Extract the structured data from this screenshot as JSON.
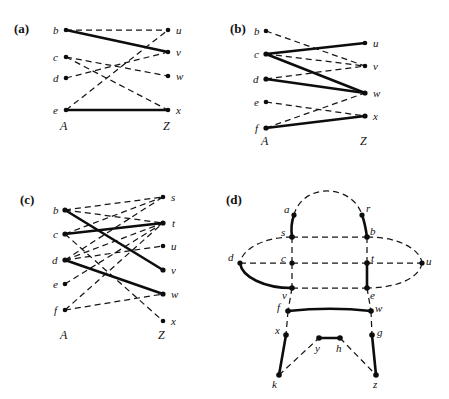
{
  "figure": {
    "panels": [
      {
        "id": "a",
        "label": "(a)",
        "type": "bipartite",
        "left_set_label": "A",
        "right_set_label": "Z",
        "left_nodes": [
          "b",
          "c",
          "d",
          "e"
        ],
        "right_nodes": [
          "u",
          "v",
          "w",
          "x"
        ],
        "edges": [
          {
            "from": "b",
            "to": "u",
            "style": "dashed"
          },
          {
            "from": "b",
            "to": "v",
            "style": "solid"
          },
          {
            "from": "c",
            "to": "w",
            "style": "dashed"
          },
          {
            "from": "c",
            "to": "x",
            "style": "dashed"
          },
          {
            "from": "d",
            "to": "v",
            "style": "dashed"
          },
          {
            "from": "e",
            "to": "u",
            "style": "dashed"
          },
          {
            "from": "e",
            "to": "x",
            "style": "solid"
          }
        ]
      },
      {
        "id": "b",
        "label": "(b)",
        "type": "bipartite",
        "left_set_label": "A",
        "right_set_label": "Z",
        "left_nodes": [
          "b",
          "c",
          "d",
          "e",
          "f"
        ],
        "right_nodes": [
          "u",
          "v",
          "w",
          "x"
        ],
        "edges": [
          {
            "from": "b",
            "to": "v",
            "style": "dashed"
          },
          {
            "from": "c",
            "to": "u",
            "style": "solid"
          },
          {
            "from": "c",
            "to": "w",
            "style": "solid"
          },
          {
            "from": "d",
            "to": "v",
            "style": "dashed"
          },
          {
            "from": "d",
            "to": "w",
            "style": "solid"
          },
          {
            "from": "e",
            "to": "x",
            "style": "dashed"
          },
          {
            "from": "f",
            "to": "w",
            "style": "dashed"
          },
          {
            "from": "f",
            "to": "x",
            "style": "solid"
          }
        ]
      },
      {
        "id": "c",
        "label": "(c)",
        "type": "bipartite",
        "left_set_label": "A",
        "right_set_label": "Z",
        "left_nodes": [
          "b",
          "c",
          "d",
          "e",
          "f"
        ],
        "right_nodes": [
          "s",
          "t",
          "u",
          "v",
          "w",
          "x"
        ],
        "edges": [
          {
            "from": "b",
            "to": "t",
            "style": "dashed"
          },
          {
            "from": "b",
            "to": "v",
            "style": "solid"
          },
          {
            "from": "c",
            "to": "s",
            "style": "dashed"
          },
          {
            "from": "c",
            "to": "t",
            "style": "solid"
          },
          {
            "from": "d",
            "to": "s",
            "style": "dashed"
          },
          {
            "from": "d",
            "to": "t",
            "style": "dashed"
          },
          {
            "from": "d",
            "to": "u",
            "style": "dashed"
          },
          {
            "from": "d",
            "to": "v",
            "style": "solid"
          },
          {
            "from": "d",
            "to": "w",
            "style": "solid"
          },
          {
            "from": "e",
            "to": "t",
            "style": "dashed"
          },
          {
            "from": "f",
            "to": "t",
            "style": "dashed"
          },
          {
            "from": "f",
            "to": "w",
            "style": "dashed"
          },
          {
            "from": "c",
            "to": "x",
            "style": "dashed"
          }
        ]
      },
      {
        "id": "d",
        "label": "(d)",
        "type": "general",
        "nodes": [
          "a",
          "r",
          "s",
          "b",
          "d",
          "c",
          "t",
          "u",
          "v",
          "e",
          "f",
          "w",
          "x",
          "g",
          "y",
          "h",
          "k",
          "z"
        ],
        "edges": [
          {
            "from": "a",
            "to": "r",
            "style": "dashed"
          },
          {
            "from": "a",
            "to": "s",
            "style": "solid"
          },
          {
            "from": "r",
            "to": "b",
            "style": "solid"
          },
          {
            "from": "s",
            "to": "b",
            "style": "dashed"
          },
          {
            "from": "s",
            "to": "d",
            "style": "dashed"
          },
          {
            "from": "b",
            "to": "u",
            "style": "dashed"
          },
          {
            "from": "s",
            "to": "c",
            "style": "dashed"
          },
          {
            "from": "b",
            "to": "t",
            "style": "dashed"
          },
          {
            "from": "d",
            "to": "c",
            "style": "dashed"
          },
          {
            "from": "c",
            "to": "t",
            "style": "dashed"
          },
          {
            "from": "t",
            "to": "u",
            "style": "dashed"
          },
          {
            "from": "d",
            "to": "v",
            "style": "solid"
          },
          {
            "from": "u",
            "to": "e",
            "style": "dashed"
          },
          {
            "from": "c",
            "to": "v",
            "style": "dashed"
          },
          {
            "from": "t",
            "to": "e",
            "style": "solid"
          },
          {
            "from": "v",
            "to": "e",
            "style": "dashed"
          },
          {
            "from": "v",
            "to": "f",
            "style": "dashed"
          },
          {
            "from": "e",
            "to": "w",
            "style": "dashed"
          },
          {
            "from": "f",
            "to": "w",
            "style": "solid"
          },
          {
            "from": "f",
            "to": "x",
            "style": "dashed"
          },
          {
            "from": "w",
            "to": "g",
            "style": "dashed"
          },
          {
            "from": "x",
            "to": "k",
            "style": "solid"
          },
          {
            "from": "k",
            "to": "y",
            "style": "dashed"
          },
          {
            "from": "y",
            "to": "h",
            "style": "solid"
          },
          {
            "from": "h",
            "to": "z",
            "style": "dashed"
          },
          {
            "from": "g",
            "to": "z",
            "style": "solid"
          }
        ]
      }
    ]
  }
}
